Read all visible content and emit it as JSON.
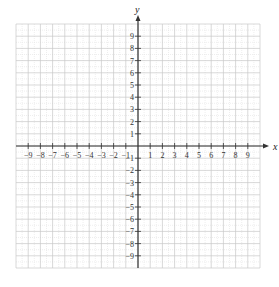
{
  "chart_data": {
    "type": "coordinate-grid",
    "title": "",
    "xlabel": "x",
    "ylabel": "y",
    "xlim": [
      -10,
      10
    ],
    "ylim": [
      -10,
      10
    ],
    "grid": true,
    "x_ticks": [
      -9,
      -8,
      -7,
      -6,
      -5,
      -4,
      -3,
      -2,
      -1,
      1,
      2,
      3,
      4,
      5,
      6,
      7,
      8,
      9
    ],
    "y_ticks": [
      -9,
      -8,
      -7,
      -6,
      -5,
      -4,
      -3,
      -2,
      -1,
      1,
      2,
      3,
      4,
      5,
      6,
      7,
      8,
      9
    ],
    "x_tick_labels": [
      "−9",
      "−8",
      "−7",
      "−6",
      "−5",
      "−4",
      "−3",
      "−2",
      "−1",
      "1",
      "2",
      "3",
      "4",
      "5",
      "6",
      "7",
      "8",
      "9"
    ],
    "y_tick_labels": [
      "−9",
      "−8",
      "−7",
      "−6",
      "−5",
      "−4",
      "−3",
      "−2",
      "−1",
      "1",
      "2",
      "3",
      "4",
      "5",
      "6",
      "7",
      "8",
      "9"
    ],
    "series": [],
    "legend": null
  },
  "colors": {
    "grid_major": "#c8c8c8",
    "grid_minor": "#e2e2e2",
    "axis": "#333333",
    "background": "#ffffff"
  }
}
